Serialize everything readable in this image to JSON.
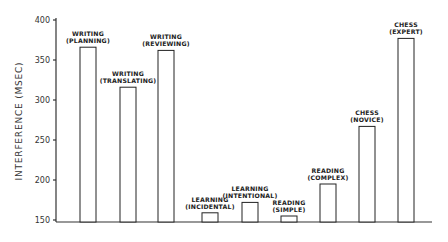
{
  "chart_data": {
    "type": "bar",
    "title": "",
    "xlabel": "",
    "ylabel": "INTERFERENCE (MSEC)",
    "ylim": [
      150,
      400
    ],
    "yticks": [
      150,
      200,
      250,
      300,
      350,
      400
    ],
    "grid": false,
    "legend": null,
    "categories": [
      [
        "WRITING",
        "(PLANNING)"
      ],
      [
        "WRITING",
        "(TRANSLATING)"
      ],
      [
        "WRITING",
        "(REVIEWING)"
      ],
      [
        "LEARNING",
        "(INCIDENTAL)"
      ],
      [
        "LEARNING",
        "(INTENTIONAL)"
      ],
      [
        "READING",
        "(SIMPLE)"
      ],
      [
        "READING",
        "(COMPLEX)"
      ],
      [
        "CHESS",
        "(NOVICE)"
      ],
      [
        "CHESS",
        "(EXPERT)"
      ]
    ],
    "values": [
      366,
      316,
      362,
      159,
      172,
      155,
      195,
      267,
      377
    ]
  }
}
